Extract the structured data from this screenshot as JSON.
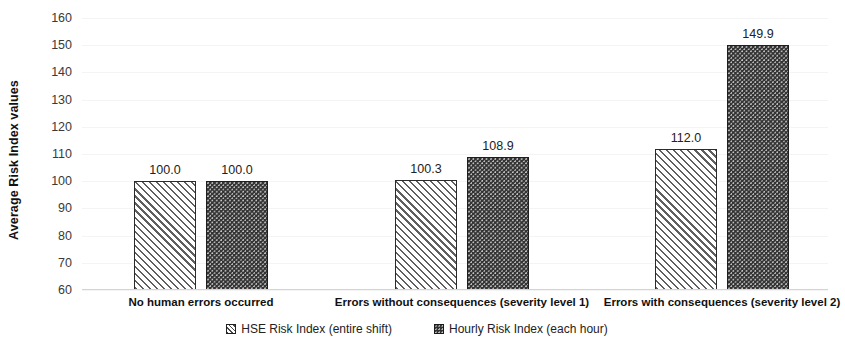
{
  "chart_data": {
    "type": "bar",
    "title": "",
    "xlabel": "",
    "ylabel": "Average  Risk Index values",
    "ylim": [
      60,
      160
    ],
    "ytick_step": 10,
    "ytick_labels": [
      "160",
      "150",
      "140",
      "130",
      "120",
      "110",
      "100",
      "90",
      "80",
      "70",
      "60"
    ],
    "grid": true,
    "legend_position": "bottom",
    "categories": [
      "No human errors occurred",
      "Errors without consequences (severity level 1)",
      "Errors with consequences (severity level 2)"
    ],
    "series": [
      {
        "name": "HSE Risk Index (entire shift)",
        "pattern": "diagonal-hatch",
        "color": "#ffffff",
        "border_color": "#2b2b2b",
        "values": [
          100.0,
          100.3,
          112.0
        ],
        "labels": [
          "100.0",
          "100.3",
          "112.0"
        ]
      },
      {
        "name": "Hourly Risk Index (each hour)",
        "pattern": "dotted-dark",
        "color": "#333333",
        "border_color": "#1e1e1e",
        "values": [
          100.0,
          108.9,
          149.9
        ],
        "labels": [
          "100.0",
          "108.9",
          "149.9"
        ]
      }
    ]
  },
  "legend": {
    "items": [
      {
        "label": "HSE Risk Index (entire shift)",
        "swatch": "hatch-square-icon"
      },
      {
        "label": "Hourly Risk Index (each hour)",
        "swatch": "filled-square-icon"
      }
    ]
  }
}
